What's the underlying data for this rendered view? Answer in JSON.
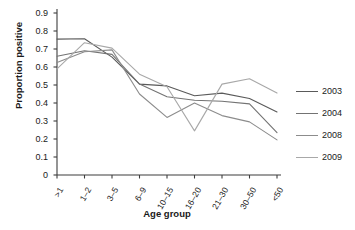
{
  "chart_data": {
    "type": "line",
    "title": "",
    "xlabel": "Age group",
    "ylabel": "Proportion positive",
    "categories": [
      ">1",
      "1–2",
      "3–5",
      "6–9",
      "10–15",
      "16–20",
      "21–30",
      "30–50",
      "<50"
    ],
    "ylim": [
      0,
      0.9
    ],
    "yticks": [
      "0",
      "0.1",
      "0.2",
      "0.3",
      "0.4",
      "0.5",
      "0.6",
      "0.7",
      "0.8",
      "0.9"
    ],
    "ytick_values": [
      0,
      0.1,
      0.2,
      0.3,
      0.4,
      0.5,
      0.6,
      0.7,
      0.8,
      0.9
    ],
    "grid": false,
    "legend_position": "right",
    "series": [
      {
        "name": "2003",
        "color": "#5a5a5a",
        "values": [
          0.755,
          0.757,
          0.655,
          0.505,
          0.495,
          0.44,
          0.455,
          0.425,
          0.35
        ]
      },
      {
        "name": "2004",
        "color": "#737373",
        "values": [
          0.66,
          0.69,
          0.67,
          0.505,
          0.435,
          0.415,
          0.41,
          0.395,
          0.235
        ]
      },
      {
        "name": "2008",
        "color": "#8c8c8c",
        "values": [
          0.625,
          0.685,
          0.695,
          0.45,
          0.32,
          0.4,
          0.33,
          0.295,
          0.195
        ]
      },
      {
        "name": "2009",
        "color": "#a8a8a8",
        "values": [
          0.59,
          0.735,
          0.705,
          0.56,
          0.49,
          0.245,
          0.505,
          0.535,
          0.455
        ]
      }
    ]
  }
}
